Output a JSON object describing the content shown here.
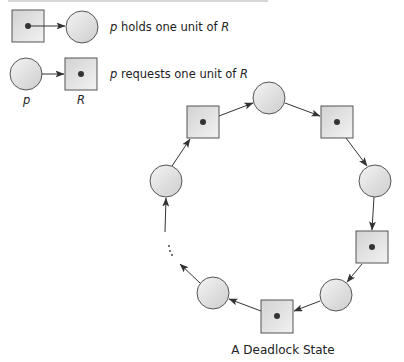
{
  "figure": {
    "caption": "A Deadlock State",
    "colors": {
      "node_fill_light": "#f2f2f2",
      "node_fill_dark": "#c8c8c8",
      "node_stroke": "#555555",
      "edge": "#333333",
      "dot": "#333333",
      "text": "#222222"
    }
  },
  "legend": {
    "items": [
      {
        "id": "holds",
        "prefix": "p",
        "text": " holds one unit of ",
        "suffix": "R",
        "from": "resource",
        "to": "process"
      },
      {
        "id": "requests",
        "prefix": "p",
        "text": " requests one unit of ",
        "suffix": "R",
        "from": "process",
        "to": "resource"
      }
    ],
    "process_label": "p",
    "resource_label": "R"
  },
  "graph": {
    "ellipsis": "...",
    "nodes": [
      {
        "id": "r1",
        "type": "resource",
        "cx": 203,
        "cy": 122
      },
      {
        "id": "p1",
        "type": "process",
        "cx": 269,
        "cy": 98
      },
      {
        "id": "r2",
        "type": "resource",
        "cx": 337,
        "cy": 122
      },
      {
        "id": "p2",
        "type": "process",
        "cx": 375,
        "cy": 181
      },
      {
        "id": "r3",
        "type": "resource",
        "cx": 372,
        "cy": 247
      },
      {
        "id": "p3",
        "type": "process",
        "cx": 336,
        "cy": 295
      },
      {
        "id": "r4",
        "type": "resource",
        "cx": 277,
        "cy": 316
      },
      {
        "id": "p4",
        "type": "process",
        "cx": 213,
        "cy": 293
      },
      {
        "id": "p0",
        "type": "process",
        "cx": 166,
        "cy": 181
      }
    ],
    "edges": [
      {
        "from": "r1",
        "to": "p1"
      },
      {
        "from": "p1",
        "to": "r2"
      },
      {
        "from": "r2",
        "to": "p2"
      },
      {
        "from": "p2",
        "to": "r3"
      },
      {
        "from": "r3",
        "to": "p3"
      },
      {
        "from": "p3",
        "to": "r4"
      },
      {
        "from": "r4",
        "to": "p4"
      },
      {
        "from": "p0",
        "to": "r1"
      }
    ]
  }
}
